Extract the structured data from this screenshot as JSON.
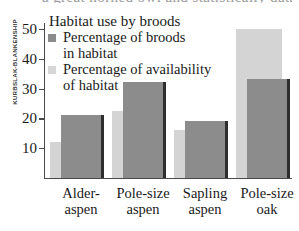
{
  "credit": {
    "text": "KURBSLAK-BLANKENSHIP"
  },
  "title_remnant": {
    "text": "a great horned owl and statistically data"
  },
  "legend": {
    "title": "Habitat use by broods",
    "entries": [
      {
        "swatch": "dark-swatch-icon",
        "line1": "Percentage of broods",
        "line2": "in habitat",
        "color": "#8c8c8c"
      },
      {
        "swatch": "light-swatch-icon",
        "line1": "Percentage of availability",
        "line2": "of habitat",
        "color": "#d7d7d7"
      }
    ]
  },
  "axis": {
    "y_ticks": [
      "10",
      "20",
      "30",
      "40",
      "50"
    ]
  },
  "categories_display": [
    {
      "line1": "Alder-",
      "line2": "aspen"
    },
    {
      "line1": "Pole-size",
      "line2": "aspen"
    },
    {
      "line1": "Sapling",
      "line2": "aspen"
    },
    {
      "line1": "Pole-size",
      "line2": "oak"
    }
  ],
  "chart_data": {
    "type": "bar",
    "title": "Habitat use by broods",
    "xlabel": "",
    "ylabel": "",
    "ylim": [
      0,
      52
    ],
    "grid": false,
    "legend_position": "top-left inside plot",
    "categories": [
      "Alder-aspen",
      "Pole-size aspen",
      "Sapling aspen",
      "Pole-size oak"
    ],
    "series": [
      {
        "name": "Percentage of availability of habitat",
        "color": "#d4d4d4",
        "values": [
          12,
          22.5,
          16,
          50
        ]
      },
      {
        "name": "Percentage of broods in habitat",
        "color": "#8c8c8c",
        "values": [
          21,
          32,
          19,
          33
        ]
      }
    ],
    "yticks": [
      10,
      20,
      30,
      40,
      50
    ]
  }
}
